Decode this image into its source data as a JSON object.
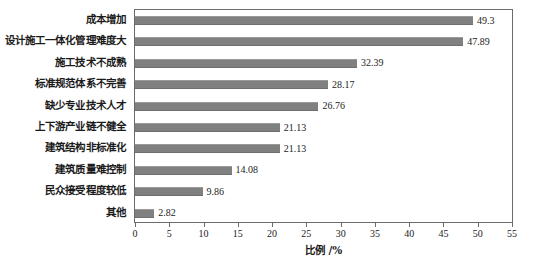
{
  "chart_data": {
    "type": "bar",
    "orientation": "horizontal",
    "title": "",
    "xlabel": "比例 /%",
    "ylabel": "",
    "xlim": [
      0,
      55
    ],
    "xticks": [
      0,
      5,
      10,
      15,
      20,
      25,
      30,
      35,
      40,
      45,
      50,
      55
    ],
    "xtick_labels": [
      "0",
      "5",
      "10",
      "15",
      "20",
      "25",
      "30",
      "35",
      "40",
      "45",
      "50",
      "55"
    ],
    "grid": false,
    "legend": null,
    "bar_color": "#808080",
    "categories": [
      "成本增加",
      "设计施工一体化管理难度大",
      "施工技术不成熟",
      "标准规范体系不完善",
      "缺少专业技术人才",
      "上下游产业链不健全",
      "建筑结构非标准化",
      "建筑质量难控制",
      "民众接受程度较低",
      "其他"
    ],
    "values": [
      49.3,
      47.89,
      32.39,
      28.17,
      26.76,
      21.13,
      21.13,
      14.08,
      9.86,
      2.82
    ],
    "value_labels": [
      "49.3",
      "47.89",
      "32.39",
      "28.17",
      "26.76",
      "21.13",
      "21.13",
      "14.08",
      "9.86",
      "2.82"
    ]
  }
}
